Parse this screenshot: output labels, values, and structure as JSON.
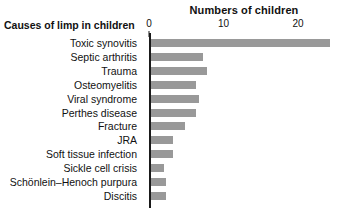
{
  "chart_data": {
    "type": "bar",
    "orientation": "horizontal",
    "title": "Numbers of children",
    "xlabel": "Numbers of children",
    "ylabel": "Causes of limp in children",
    "categories": [
      "Toxic synovitis",
      "Septic arthritis",
      "Trauma",
      "Osteomyelitis",
      "Viral syndrome",
      "Perthes disease",
      "Fracture",
      "JRA",
      "Soft tissue infection",
      "Sickle cell crisis",
      "Schönlein–Henoch purpura",
      "Discitis"
    ],
    "values": [
      24,
      7,
      7.5,
      6,
      6.5,
      6,
      4.5,
      3,
      3,
      1.7,
      2,
      2
    ],
    "xlim": [
      0,
      25.5
    ],
    "xticks": [
      0,
      10,
      20
    ],
    "xticklabels": [
      "0",
      "10",
      "20"
    ],
    "grid": false,
    "legend": false,
    "bar_color": "#999999",
    "axis_color": "#1a1a1a",
    "background_color": "#ffffff"
  },
  "header": {
    "top_title": "Numbers of children",
    "category_header": "Causes of limp in children"
  },
  "bars": [
    {
      "label": "Toxic synovitis",
      "value": 24
    },
    {
      "label": "Septic arthritis",
      "value": 7
    },
    {
      "label": "Trauma",
      "value": 7.5
    },
    {
      "label": "Osteomyelitis",
      "value": 6
    },
    {
      "label": "Viral syndrome",
      "value": 6.5
    },
    {
      "label": "Perthes disease",
      "value": 6
    },
    {
      "label": "Fracture",
      "value": 4.5
    },
    {
      "label": "JRA",
      "value": 3
    },
    {
      "label": "Soft tissue infection",
      "value": 3
    },
    {
      "label": "Sickle cell crisis",
      "value": 1.7
    },
    {
      "label": "Schönlein–Henoch purpura",
      "value": 2
    },
    {
      "label": "Discitis",
      "value": 2
    }
  ],
  "xticks": [
    {
      "label": "0",
      "value": 0
    },
    {
      "label": "10",
      "value": 10
    },
    {
      "label": "20",
      "value": 20
    }
  ]
}
